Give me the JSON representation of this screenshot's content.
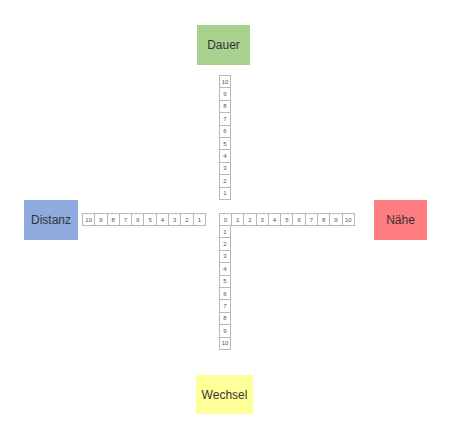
{
  "poles": {
    "top": {
      "label": "Dauer",
      "color": "#a9d18e"
    },
    "left": {
      "label": "Distanz",
      "color": "#8faadc"
    },
    "right": {
      "label": "Nähe",
      "color": "#ff7c80"
    },
    "bottom": {
      "label": "Wechsel",
      "color": "#ffff99"
    }
  },
  "axes": {
    "vertical_top": [
      "10",
      "9",
      "8",
      "7",
      "6",
      "5",
      "4",
      "3",
      "2",
      "1"
    ],
    "horizontal_left": [
      "10",
      "9",
      "8",
      "7",
      "6",
      "5",
      "4",
      "3",
      "2",
      "1"
    ],
    "center": "0",
    "horizontal_right": [
      "1",
      "2",
      "3",
      "4",
      "5",
      "6",
      "7",
      "8",
      "9",
      "10"
    ],
    "vertical_bottom": [
      "1",
      "2",
      "3",
      "4",
      "5",
      "6",
      "7",
      "8",
      "9",
      "10"
    ]
  }
}
